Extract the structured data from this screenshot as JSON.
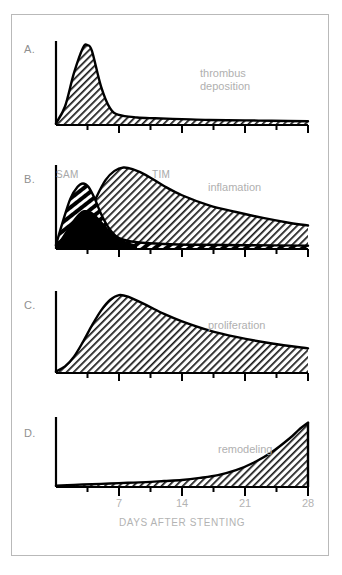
{
  "figure": {
    "axis_title": "DAYS AFTER STENTING",
    "x_tick_labels": [
      "7",
      "14",
      "21",
      "28"
    ],
    "label_color": "#b0b0b0",
    "curve_color": "#000000"
  },
  "panels": [
    {
      "letter": "A.",
      "label": "thrombus\ndeposition",
      "curve_names": []
    },
    {
      "letter": "B.",
      "label": "inflamation",
      "curve_names": [
        "SAM",
        "TIM"
      ]
    },
    {
      "letter": "C.",
      "label": "proliferation",
      "curve_names": []
    },
    {
      "letter": "D.",
      "label": "remodeling",
      "curve_names": []
    }
  ],
  "chart_data": [
    {
      "type": "area",
      "title": "thrombus deposition",
      "panel": "A",
      "xlabel": "DAYS AFTER STENTING",
      "ylabel": "",
      "xlim": [
        0,
        28
      ],
      "ylim": [
        0,
        1
      ],
      "grid": false,
      "x": [
        0,
        1,
        2,
        3,
        3.5,
        4,
        5,
        6,
        7,
        9,
        11,
        14,
        17,
        21,
        24,
        28
      ],
      "values": [
        0.02,
        0.22,
        0.62,
        0.92,
        0.95,
        0.88,
        0.46,
        0.2,
        0.12,
        0.09,
        0.08,
        0.07,
        0.06,
        0.055,
        0.05,
        0.045
      ]
    },
    {
      "type": "area",
      "title": "inflamation",
      "panel": "B",
      "xlabel": "DAYS AFTER STENTING",
      "ylabel": "",
      "xlim": [
        0,
        28
      ],
      "ylim": [
        0,
        1
      ],
      "grid": false,
      "series": [
        {
          "name": "SAM",
          "x": [
            0,
            0.8,
            1.6,
            2.4,
            3.0,
            3.6,
            4.3,
            5.0,
            5.8,
            6.6,
            7.5,
            9,
            12,
            16,
            21,
            28
          ],
          "values": [
            0.05,
            0.34,
            0.6,
            0.74,
            0.78,
            0.74,
            0.6,
            0.42,
            0.26,
            0.16,
            0.11,
            0.08,
            0.06,
            0.05,
            0.045,
            0.04
          ]
        },
        {
          "name": "TIM",
          "x": [
            0,
            1.5,
            3,
            4.5,
            5.5,
            6.5,
            7.5,
            8.5,
            10,
            12,
            14,
            17,
            20,
            23,
            26,
            28
          ],
          "values": [
            0.04,
            0.1,
            0.26,
            0.62,
            0.82,
            0.93,
            0.97,
            0.95,
            0.88,
            0.75,
            0.64,
            0.52,
            0.44,
            0.37,
            0.31,
            0.28
          ]
        }
      ]
    },
    {
      "type": "area",
      "title": "proliferation",
      "panel": "C",
      "xlabel": "DAYS AFTER STENTING",
      "ylabel": "",
      "xlim": [
        0,
        28
      ],
      "ylim": [
        0,
        1
      ],
      "grid": false,
      "x": [
        0,
        1,
        2,
        3,
        4,
        5,
        6,
        7,
        8,
        10,
        12,
        14,
        17,
        20,
        24,
        28
      ],
      "values": [
        0.02,
        0.08,
        0.2,
        0.38,
        0.58,
        0.76,
        0.89,
        0.95,
        0.93,
        0.83,
        0.72,
        0.63,
        0.52,
        0.44,
        0.36,
        0.3
      ]
    },
    {
      "type": "area",
      "title": "remodeling",
      "panel": "D",
      "xlabel": "DAYS AFTER STENTING",
      "ylabel": "",
      "xlim": [
        0,
        28
      ],
      "ylim": [
        0,
        1
      ],
      "grid": false,
      "x": [
        0,
        2,
        4,
        6,
        8,
        10,
        12,
        14,
        16,
        18,
        20,
        22,
        24,
        26,
        27,
        28
      ],
      "values": [
        0.02,
        0.03,
        0.04,
        0.05,
        0.06,
        0.07,
        0.085,
        0.1,
        0.13,
        0.17,
        0.24,
        0.35,
        0.5,
        0.7,
        0.82,
        0.92
      ]
    }
  ]
}
